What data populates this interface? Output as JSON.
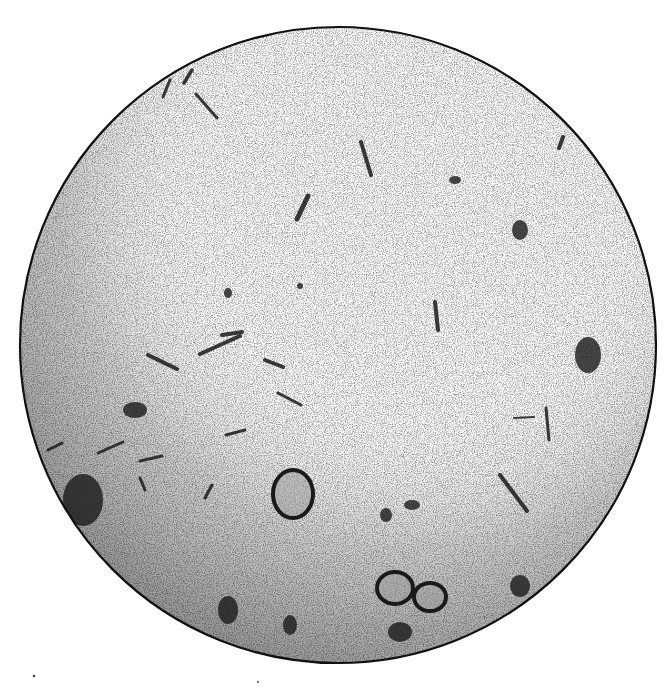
{
  "figure": {
    "shape": "circle",
    "center": [
      338,
      345
    ],
    "radius": 318,
    "colors": {
      "background": "#ffffff",
      "outline": "#111111",
      "ink": "#1a1a1a",
      "shade_dark": "#6a6a6a",
      "shade_light": "#f4f4f4"
    },
    "rods": [
      {
        "x1": 163,
        "y1": 97,
        "x2": 170,
        "y2": 80,
        "w": 3
      },
      {
        "x1": 184,
        "y1": 83,
        "x2": 192,
        "y2": 70,
        "w": 3.5
      },
      {
        "x1": 196,
        "y1": 94,
        "x2": 217,
        "y2": 118,
        "w": 3
      },
      {
        "x1": 361,
        "y1": 142,
        "x2": 371,
        "y2": 175,
        "w": 4
      },
      {
        "x1": 297,
        "y1": 219,
        "x2": 308,
        "y2": 196,
        "w": 5
      },
      {
        "x1": 435,
        "y1": 302,
        "x2": 438,
        "y2": 330,
        "w": 4
      },
      {
        "x1": 222,
        "y1": 335,
        "x2": 242,
        "y2": 332,
        "w": 4
      },
      {
        "x1": 148,
        "y1": 355,
        "x2": 177,
        "y2": 369,
        "w": 4
      },
      {
        "x1": 200,
        "y1": 354,
        "x2": 240,
        "y2": 336,
        "w": 4
      },
      {
        "x1": 265,
        "y1": 360,
        "x2": 283,
        "y2": 367,
        "w": 4
      },
      {
        "x1": 278,
        "y1": 393,
        "x2": 301,
        "y2": 405,
        "w": 3
      },
      {
        "x1": 226,
        "y1": 435,
        "x2": 245,
        "y2": 430,
        "w": 3
      },
      {
        "x1": 140,
        "y1": 461,
        "x2": 162,
        "y2": 456,
        "w": 3
      },
      {
        "x1": 205,
        "y1": 498,
        "x2": 212,
        "y2": 485,
        "w": 3
      },
      {
        "x1": 500,
        "y1": 475,
        "x2": 527,
        "y2": 511,
        "w": 4
      },
      {
        "x1": 546,
        "y1": 408,
        "x2": 549,
        "y2": 440,
        "w": 3
      },
      {
        "x1": 514,
        "y1": 418,
        "x2": 534,
        "y2": 417,
        "w": 2
      },
      {
        "x1": 48,
        "y1": 450,
        "x2": 62,
        "y2": 443,
        "w": 3
      },
      {
        "x1": 98,
        "y1": 453,
        "x2": 123,
        "y2": 442,
        "w": 3
      },
      {
        "x1": 140,
        "y1": 478,
        "x2": 145,
        "y2": 490,
        "w": 3
      },
      {
        "x1": 559,
        "y1": 148,
        "x2": 563,
        "y2": 137,
        "w": 4
      }
    ],
    "blobs": [
      {
        "cx": 293,
        "cy": 494,
        "rx": 20,
        "ry": 24,
        "ring": true
      },
      {
        "cx": 386,
        "cy": 515,
        "rx": 6,
        "ry": 7,
        "ring": false
      },
      {
        "cx": 412,
        "cy": 505,
        "rx": 8,
        "ry": 5,
        "ring": false
      },
      {
        "cx": 588,
        "cy": 355,
        "rx": 13,
        "ry": 18,
        "ring": false
      },
      {
        "cx": 520,
        "cy": 230,
        "rx": 8,
        "ry": 10,
        "ring": false
      },
      {
        "cx": 135,
        "cy": 410,
        "rx": 12,
        "ry": 8,
        "ring": false
      },
      {
        "cx": 83,
        "cy": 500,
        "rx": 20,
        "ry": 26,
        "ring": false
      },
      {
        "cx": 228,
        "cy": 610,
        "rx": 10,
        "ry": 14,
        "ring": false
      },
      {
        "cx": 290,
        "cy": 625,
        "rx": 7,
        "ry": 10,
        "ring": false
      },
      {
        "cx": 395,
        "cy": 588,
        "rx": 18,
        "ry": 16,
        "ring": true
      },
      {
        "cx": 430,
        "cy": 597,
        "rx": 16,
        "ry": 14,
        "ring": true
      },
      {
        "cx": 400,
        "cy": 632,
        "rx": 12,
        "ry": 10,
        "ring": false
      },
      {
        "cx": 520,
        "cy": 586,
        "rx": 10,
        "ry": 11,
        "ring": false
      },
      {
        "cx": 228,
        "cy": 293,
        "rx": 4,
        "ry": 5,
        "ring": false
      },
      {
        "cx": 300,
        "cy": 286,
        "rx": 3,
        "ry": 3,
        "ring": false
      },
      {
        "cx": 455,
        "cy": 180,
        "rx": 6,
        "ry": 4,
        "ring": false
      }
    ]
  }
}
